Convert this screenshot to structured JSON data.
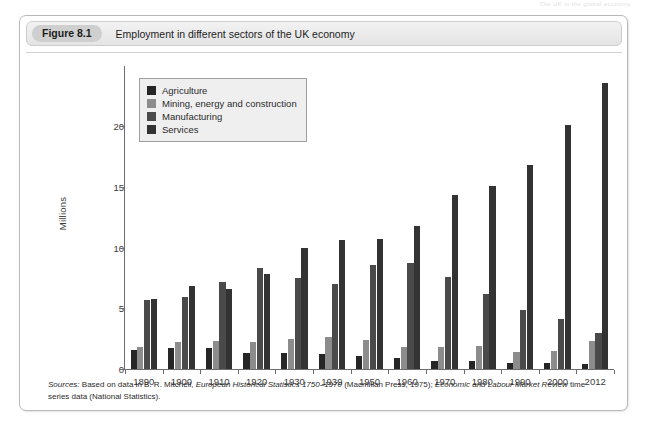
{
  "running_head": "The UK in the global economy",
  "figure": {
    "tag": "Figure 8.1",
    "title": "Employment in different sectors of the UK economy"
  },
  "sources": {
    "lead": "Sources:",
    "part1": " Based on data in B. R. Mitchell, ",
    "italic1": "European Historical Statistics 1750–1970",
    "part2": " (Macmillan Press, 1975); ",
    "italic2": "Economic and Labour Market Review",
    "part3": " time series data (National Statistics)."
  },
  "legend": {
    "items": [
      {
        "label": "Agriculture",
        "color": "#262626"
      },
      {
        "label": "Mining, energy and construction",
        "color": "#8c8c8c"
      },
      {
        "label": "Manufacturing",
        "color": "#4a4a4a"
      },
      {
        "label": "Services",
        "color": "#333333"
      }
    ]
  },
  "chart_data": {
    "type": "bar",
    "title": "Employment in different sectors of the UK economy",
    "xlabel": "",
    "ylabel": "Millions",
    "ylim": [
      0,
      24
    ],
    "yticks": [
      0,
      5,
      10,
      15,
      20
    ],
    "grid": false,
    "legend_position": "top-left",
    "categories": [
      "1890",
      "1900",
      "1910",
      "1920",
      "1930",
      "1939",
      "1950",
      "1960",
      "1970",
      "1980",
      "1990",
      "2000",
      "2012"
    ],
    "series": [
      {
        "name": "Agriculture",
        "color": "#262626",
        "values": [
          1.6,
          1.7,
          1.7,
          1.3,
          1.3,
          1.2,
          1.1,
          0.9,
          0.7,
          0.7,
          0.5,
          0.5,
          0.4
        ]
      },
      {
        "name": "Mining, energy and construction",
        "color": "#8c8c8c",
        "values": [
          1.8,
          2.2,
          2.3,
          2.2,
          2.5,
          2.6,
          2.4,
          1.8,
          1.8,
          1.9,
          1.4,
          1.5,
          2.3
        ]
      },
      {
        "name": "Manufacturing",
        "color": "#4a4a4a",
        "values": [
          5.7,
          5.9,
          7.2,
          8.3,
          7.5,
          7.0,
          8.6,
          8.7,
          7.6,
          6.2,
          4.9,
          4.1,
          3.0
        ]
      },
      {
        "name": "Services",
        "color": "#333333",
        "values": [
          5.8,
          6.8,
          6.6,
          7.8,
          10.0,
          10.6,
          10.7,
          11.8,
          14.3,
          15.1,
          16.8,
          20.1,
          23.6
        ]
      }
    ]
  }
}
